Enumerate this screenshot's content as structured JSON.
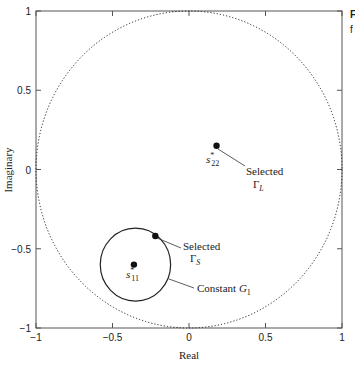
{
  "chart_data": {
    "type": "scatter",
    "title": "",
    "xlabel": "Real",
    "ylabel": "Imaginary",
    "xlim": [
      -1,
      1
    ],
    "ylim": [
      -1,
      1
    ],
    "grid": false,
    "xticks": [
      -1,
      -0.5,
      0,
      0.5,
      1
    ],
    "yticks": [
      -1,
      -0.5,
      0,
      0.5,
      1
    ],
    "xtick_labels": [
      "−1",
      "−0.5",
      "0",
      "0.5",
      "1"
    ],
    "ytick_labels": [
      "−1",
      "−0.5",
      "0",
      "0.5",
      "1"
    ],
    "circles": [
      {
        "name": "unit-circle",
        "center": [
          0,
          0
        ],
        "radius": 1,
        "style": "dotted"
      },
      {
        "name": "constant-gain-circle",
        "center": [
          -0.35,
          -0.6
        ],
        "radius": 0.23,
        "style": "solid"
      }
    ],
    "points": [
      {
        "name": "s22-conjugate",
        "x": 0.18,
        "y": 0.15,
        "label": "s",
        "label_sub": "22",
        "label_sup": "*"
      },
      {
        "name": "s11-conjugate",
        "x": -0.36,
        "y": -0.6,
        "label": "s",
        "label_sub": "11",
        "label_sup": "*"
      },
      {
        "name": "selected-gamma-s",
        "x": -0.22,
        "y": -0.42
      }
    ],
    "annotations": [
      {
        "name": "selected-gamma-l",
        "line1": "Selected",
        "line2": "Γ",
        "line2_sub": "L"
      },
      {
        "name": "selected-gamma-s",
        "line1": "Selected",
        "line2": "Γ",
        "line2_sub": "S"
      },
      {
        "name": "constant-g1",
        "line1": "Constant ",
        "italic": "G",
        "sub": "1"
      }
    ],
    "clipped_margin_text": [
      "F",
      "f"
    ]
  }
}
